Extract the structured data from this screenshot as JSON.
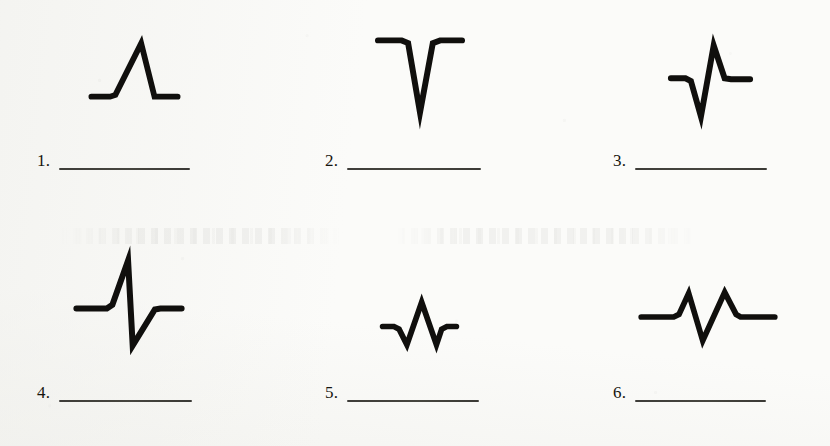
{
  "page": {
    "kind": "scanned-worksheet",
    "width": 830,
    "height": 446,
    "paper_color": "#fbfbf9",
    "ink_color": "#100f0d",
    "rule_color": "#2e2d29"
  },
  "items": [
    {
      "number": "1.",
      "waveform_name": "positive-triangular-pulse",
      "description": "flat baseline with a single tall narrow upward spike",
      "points": "0,62 21,62 27,60 56,2 71,62 97,62"
    },
    {
      "number": "2.",
      "waveform_name": "negative-triangular-pulse",
      "description": "flat baseline with a single deep narrow downward spike",
      "points": "0,3 26,3 33,6 46,82 60,6 68,3 92,3"
    },
    {
      "number": "3.",
      "waveform_name": "negative-then-positive-biphasic-pulse",
      "description": "baseline dips down then swings up above baseline before returning",
      "points": "0,38 16,38 22,41 33,80 47,2 59,38 66,39 87,39"
    },
    {
      "number": "4.",
      "waveform_name": "positive-then-negative-biphasic-pulse",
      "description": "baseline rises to a peak then drops sharply below baseline before returning",
      "points": "0,54 33,54 39,50 56,2 61,94 85,55 91,54 114,54"
    },
    {
      "number": "5.",
      "waveform_name": "small-amplitude-oscillation",
      "description": "short low-amplitude down-up-down wiggle about the baseline",
      "points": "0,30 13,30 19,33 28,51 45,2 62,51 68,33 74,30 85,30"
    },
    {
      "number": "6.",
      "waveform_name": "double-peak-oscillation",
      "description": "two upward peaks separated by a dip below the baseline",
      "points": "0,29 37,29 43,26 54,2 70,56 95,1 108,26 113,29 152,29"
    }
  ]
}
